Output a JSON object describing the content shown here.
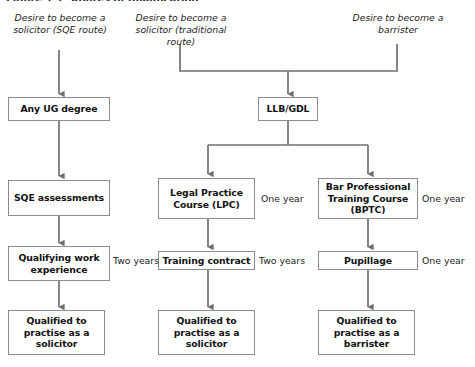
{
  "figure": {
    "title": "Figure 1.1: Routes of qualification",
    "type": "flowchart",
    "orientation": "top-to-bottom",
    "line_color": "#6f6f6f",
    "box_border_color": "#8d8d8d",
    "text_color": "#111111",
    "background": "#ffffff"
  },
  "headers": [
    {
      "id": "hdr-sqe",
      "text": "Desire to become a solicitor (SQE route)"
    },
    {
      "id": "hdr-trad",
      "text": "Desire to become a solicitor (traditional route)"
    },
    {
      "id": "hdr-barrister",
      "text": "Desire to become a barrister"
    }
  ],
  "nodes": [
    {
      "id": "any-ug-degree",
      "label": "Any UG degree"
    },
    {
      "id": "llb-gdl",
      "label": "LLB/GDL"
    },
    {
      "id": "sqe-assessments",
      "label": "SQE assessments"
    },
    {
      "id": "lpc",
      "label": "Legal Practice Course (LPC)"
    },
    {
      "id": "bptc",
      "label": "Bar Professional Training Course (BPTC)"
    },
    {
      "id": "qualifying-work-experience",
      "label": "Qualifying work experience"
    },
    {
      "id": "training-contract",
      "label": "Training contract"
    },
    {
      "id": "pupillage",
      "label": "Pupillage"
    },
    {
      "id": "qualified-solicitor-sqe",
      "label": "Qualified to practise as a solicitor"
    },
    {
      "id": "qualified-solicitor-trad",
      "label": "Qualified to practise as a solicitor"
    },
    {
      "id": "qualified-barrister",
      "label": "Qualified to practise as a barrister"
    }
  ],
  "durations": [
    {
      "id": "dur-lpc",
      "for": "lpc",
      "text": "One year"
    },
    {
      "id": "dur-bptc",
      "for": "bptc",
      "text": "One year"
    },
    {
      "id": "dur-qwe",
      "for": "qualifying-work-experience",
      "text": "Two years"
    },
    {
      "id": "dur-training-contract",
      "for": "training-contract",
      "text": "Two years"
    },
    {
      "id": "dur-pupillage",
      "for": "pupillage",
      "text": "One year"
    }
  ],
  "edges": [
    {
      "from": "hdr-sqe",
      "to": "any-ug-degree",
      "arrow": true
    },
    {
      "from": "hdr-trad",
      "to": "llb-gdl",
      "arrow": true,
      "style": "merge"
    },
    {
      "from": "hdr-barrister",
      "to": "llb-gdl",
      "arrow": true,
      "style": "merge"
    },
    {
      "from": "any-ug-degree",
      "to": "sqe-assessments",
      "arrow": true
    },
    {
      "from": "llb-gdl",
      "to": "lpc",
      "arrow": true,
      "style": "split"
    },
    {
      "from": "llb-gdl",
      "to": "bptc",
      "arrow": true,
      "style": "split"
    },
    {
      "from": "sqe-assessments",
      "to": "qualifying-work-experience",
      "arrow": true
    },
    {
      "from": "lpc",
      "to": "training-contract",
      "arrow": true
    },
    {
      "from": "bptc",
      "to": "pupillage",
      "arrow": true
    },
    {
      "from": "qualifying-work-experience",
      "to": "qualified-solicitor-sqe",
      "arrow": true
    },
    {
      "from": "training-contract",
      "to": "qualified-solicitor-trad",
      "arrow": true
    },
    {
      "from": "pupillage",
      "to": "qualified-barrister",
      "arrow": true
    }
  ]
}
